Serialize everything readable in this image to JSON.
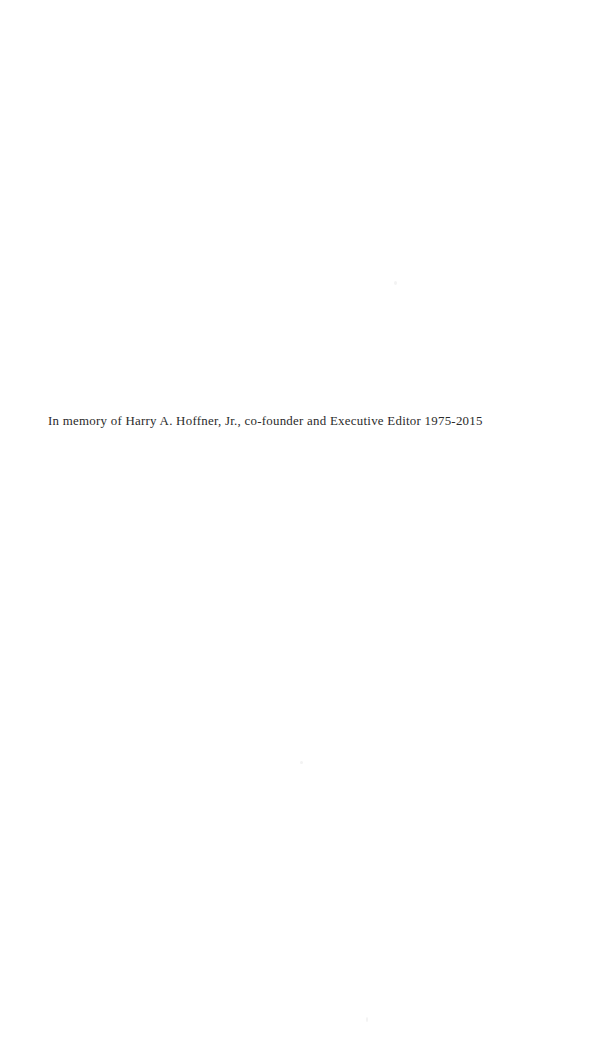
{
  "page": {
    "kind": "book-dedication-page",
    "width": 608,
    "height": 1056,
    "background_color": "#ffffff",
    "text_color": "#2b2b2b"
  },
  "dedication": {
    "text": "In memory of Harry A. Hoffner, Jr., co-founder and Executive Editor 1975-2015",
    "honoree": "Harry A. Hoffner, Jr.",
    "roles": "co-founder and Executive Editor",
    "years": "1975-2015"
  },
  "artifacts": {
    "speck_1": "",
    "speck_2": "",
    "speck_3": ""
  }
}
